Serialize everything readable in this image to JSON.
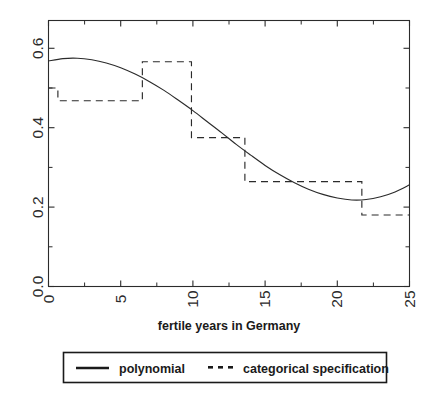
{
  "chart_data": {
    "type": "line",
    "title": "",
    "xlabel": "fertile years in Germany",
    "ylabel": "",
    "xlim": [
      0,
      25
    ],
    "ylim": [
      0.0,
      0.67
    ],
    "grid": false,
    "legend_position": "below-axes",
    "x_ticks": [
      "0",
      "5",
      "10",
      "15",
      "20",
      "25"
    ],
    "x_tick_values": [
      0,
      5,
      10,
      15,
      20,
      25
    ],
    "x_minor_tick_values": [
      2.5,
      7.5,
      12.5,
      17.5,
      22.5
    ],
    "y_ticks": [
      "0.0",
      "0.2",
      "0.4",
      "0.6"
    ],
    "y_tick_values": [
      0.0,
      0.2,
      0.4,
      0.6
    ],
    "y_minor_tick_values": [
      0.1,
      0.3,
      0.5
    ],
    "series": [
      {
        "name": "polynomial",
        "style": "solid",
        "color": "#2b2b2b",
        "x": [
          0,
          1,
          2,
          3,
          4,
          5,
          6,
          7,
          8,
          9,
          10,
          11,
          12,
          13,
          14,
          15,
          16,
          17,
          18,
          19,
          20,
          21,
          22,
          23,
          24,
          25
        ],
        "values": [
          0.568,
          0.574,
          0.575,
          0.571,
          0.563,
          0.551,
          0.535,
          0.516,
          0.494,
          0.469,
          0.443,
          0.415,
          0.387,
          0.358,
          0.331,
          0.305,
          0.282,
          0.262,
          0.245,
          0.232,
          0.223,
          0.218,
          0.219,
          0.226,
          0.238,
          0.256
        ]
      },
      {
        "name": "categorical specification",
        "style": "dashed",
        "color": "#2b2b2b",
        "step_segments": [
          {
            "x_start": 0.0,
            "x_end": 0.65,
            "y": 0.5
          },
          {
            "x_start": 0.65,
            "x_end": 6.5,
            "y": 0.468
          },
          {
            "x_start": 6.5,
            "x_end": 9.9,
            "y": 0.566
          },
          {
            "x_start": 9.9,
            "x_end": 13.6,
            "y": 0.375
          },
          {
            "x_start": 13.6,
            "x_end": 21.7,
            "y": 0.264
          },
          {
            "x_start": 21.7,
            "x_end": 25.0,
            "y": 0.18
          }
        ]
      }
    ]
  },
  "axis": {
    "xlabel": "fertile years in Germany"
  },
  "legend": {
    "items": [
      {
        "label": "polynomial",
        "marker": "solid-line"
      },
      {
        "label": "categorical specification",
        "marker": "dotted-line"
      }
    ]
  }
}
